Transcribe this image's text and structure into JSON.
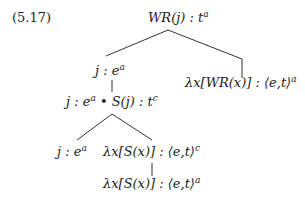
{
  "example_number": "(5.17)",
  "nodes": {
    "root": {
      "main": "WR(j) : t",
      "sup": "a"
    },
    "left": {
      "main": "j : e",
      "sup": "a"
    },
    "right": {
      "main": "λx[WR(x)] : ⟨e,t⟩",
      "sup": "a"
    },
    "compound_a": "j : e",
    "compound_a_sup": "a",
    "compound_b": " • S(j) : t",
    "compound_b_sup": "c",
    "leaf_left": {
      "main": "j : e",
      "sup": "a"
    },
    "leaf_right": {
      "main": "λx[S(x)] : ⟨e,t⟩",
      "sup": "c"
    },
    "bottom": {
      "main": "λx[S(x)] : ⟨e,t⟩",
      "sup": "a"
    }
  }
}
